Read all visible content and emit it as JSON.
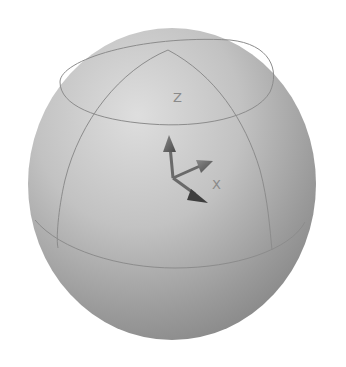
{
  "scene": {
    "background": "#ffffff",
    "object": "sphere",
    "sphere_color_light": "#dcdcdc",
    "sphere_color_dark": "#7e7e7e",
    "wire_color": "#8c8c8c"
  },
  "gizmo": {
    "axes": [
      {
        "name": "Z",
        "label": "Z"
      },
      {
        "name": "Y",
        "label": ""
      },
      {
        "name": "X",
        "label": "X"
      }
    ],
    "arrow_color": "#6a6a6a"
  }
}
